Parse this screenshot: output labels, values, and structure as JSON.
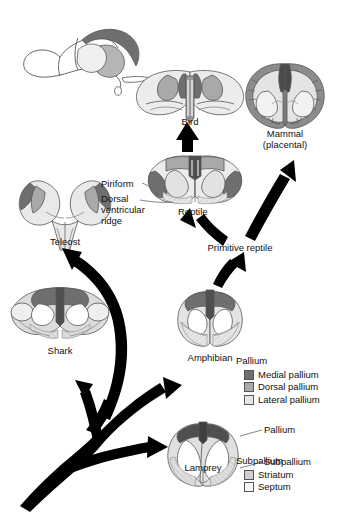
{
  "figure": {
    "type": "phylogenetic-brain-diagram",
    "title": ""
  },
  "palette": {
    "medial_pallium": "#6f6f6f",
    "dorsal_pallium": "#a9a9a9",
    "lateral_pallium": "#e6e6e6",
    "striatum": "#cfcfcf",
    "septum": "#f2f2f2",
    "outline": "#555555",
    "arrow": "#000000",
    "background": "#ffffff"
  },
  "taxa": [
    {
      "id": "bird",
      "label": "Bird"
    },
    {
      "id": "mammal",
      "label": "Mammal",
      "label2": "(placental)"
    },
    {
      "id": "reptile",
      "label": "Reptile"
    },
    {
      "id": "teleost",
      "label": "Teleost"
    },
    {
      "id": "shark",
      "label": "Shark"
    },
    {
      "id": "amphibian",
      "label": "Amphibian"
    },
    {
      "id": "lamprey",
      "label": "Lamprey"
    }
  ],
  "nodes": [
    {
      "id": "primitive-reptile",
      "label": "Primitive reptile"
    }
  ],
  "annotations": [
    {
      "id": "piriform",
      "label": "Piriform"
    },
    {
      "id": "dvr",
      "label": "Dorsal\nventricular\nridge",
      "line1": "Dorsal",
      "line2": "ventricular",
      "line3": "ridge"
    },
    {
      "id": "pallium-callout",
      "label": "Pallium"
    },
    {
      "id": "subpallium-callout",
      "label": "Subpallium"
    }
  ],
  "legend": {
    "pallium": {
      "heading": "Pallium",
      "items": [
        {
          "label": "Medial pallium",
          "color": "#6f6f6f"
        },
        {
          "label": "Dorsal pallium",
          "color": "#a9a9a9"
        },
        {
          "label": "Lateral pallium",
          "color": "#e6e6e6"
        }
      ]
    },
    "subpallium": {
      "heading": "Subpallium",
      "items": [
        {
          "label": "Striatum",
          "color": "#cfcfcf"
        },
        {
          "label": "Septum",
          "color": "#f7f7f7"
        }
      ]
    }
  }
}
